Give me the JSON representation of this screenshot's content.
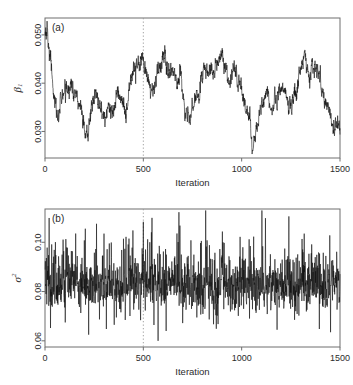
{
  "figure": {
    "background_color": "#ffffff",
    "line_color": "#111111",
    "frame_color": "#6e6e6e",
    "burnin_color": "#9a9a9a"
  },
  "panels": [
    {
      "tag": "(a)",
      "name": "panel-a",
      "ylabel_main": "β",
      "ylabel_sub": "1",
      "ylabel_sup": "",
      "xlabel": "Iteration",
      "xticks": [
        "0",
        "500",
        "1000",
        "1500"
      ],
      "yticks": [
        "0.030",
        "0.040",
        "0.050"
      ]
    },
    {
      "tag": "(b)",
      "name": "panel-b",
      "ylabel_main": "σ",
      "ylabel_sub": "",
      "ylabel_sup": "2",
      "xlabel": "Iteration",
      "xticks": [
        "0",
        "500",
        "1000",
        "1500"
      ],
      "yticks": [
        "0.06",
        "0.08",
        "0.10"
      ]
    }
  ],
  "chart_data": [
    {
      "type": "line",
      "name": "trace-beta1",
      "title": "(a)",
      "xlabel": "Iteration",
      "ylabel": "beta_1",
      "xlim": [
        0,
        1500
      ],
      "ylim": [
        0.0245,
        0.0535
      ],
      "xticks": [
        0,
        500,
        1000,
        1500
      ],
      "yticks": [
        0.03,
        0.04,
        0.05
      ],
      "grid": false,
      "legend": "none",
      "annotations": [
        {
          "kind": "vline",
          "x": 500,
          "style": "dotted",
          "label": "burn-in"
        }
      ],
      "series_description": "Highly autocorrelated MCMC random-walk trace of regression coefficient beta_1; starts near 0.051, descends to ~0.033 by iteration 60, meanders between 0.028 and 0.047, peaks ~0.046 near iteration 490 and 890, and shows a deep excursion to ~0.026 near iteration 1050 before recovering to ~0.044 and declining to ~0.031 at the end.",
      "random_walk_params": {
        "start": 0.0512,
        "mean_level": 0.0392,
        "step_sd": 0.00095,
        "reversion": 0.022,
        "seed": 20147,
        "n": 1500
      },
      "control_points": {
        "x": [
          0,
          10,
          25,
          45,
          62,
          85,
          105,
          130,
          150,
          175,
          200,
          215,
          235,
          255,
          275,
          300,
          320,
          345,
          365,
          390,
          410,
          430,
          450,
          470,
          490,
          505,
          520,
          545,
          565,
          585,
          605,
          625,
          645,
          665,
          690,
          715,
          735,
          750,
          775,
          800,
          825,
          850,
          875,
          895,
          915,
          940,
          960,
          985,
          1010,
          1035,
          1055,
          1075,
          1100,
          1125,
          1150,
          1175,
          1200,
          1225,
          1250,
          1275,
          1300,
          1320,
          1345,
          1365,
          1390,
          1415,
          1440,
          1465,
          1485,
          1500
        ],
        "y": [
          0.0505,
          0.0512,
          0.0455,
          0.0378,
          0.0331,
          0.0372,
          0.0385,
          0.0398,
          0.0381,
          0.0362,
          0.0304,
          0.0288,
          0.0336,
          0.0385,
          0.0352,
          0.0335,
          0.0352,
          0.0336,
          0.0382,
          0.0364,
          0.0332,
          0.0392,
          0.042,
          0.0438,
          0.0455,
          0.0438,
          0.0412,
          0.0378,
          0.0416,
          0.0431,
          0.0462,
          0.042,
          0.0428,
          0.0408,
          0.0415,
          0.0331,
          0.0325,
          0.0356,
          0.0372,
          0.042,
          0.0432,
          0.0418,
          0.0445,
          0.0458,
          0.0432,
          0.0412,
          0.0428,
          0.0402,
          0.0368,
          0.033,
          0.0262,
          0.0298,
          0.0352,
          0.0378,
          0.0348,
          0.0362,
          0.0395,
          0.0372,
          0.0352,
          0.0378,
          0.0425,
          0.0452,
          0.0408,
          0.0444,
          0.0412,
          0.038,
          0.0352,
          0.0312,
          0.0318,
          0.0305
        ]
      }
    },
    {
      "type": "line",
      "name": "trace-sigma2",
      "title": "(b)",
      "xlabel": "Iteration",
      "ylabel": "sigma^2",
      "xlim": [
        0,
        1500
      ],
      "ylim": [
        0.0575,
        0.1135
      ],
      "xticks": [
        0,
        500,
        1000,
        1500
      ],
      "yticks": [
        0.06,
        0.08,
        0.1
      ],
      "grid": false,
      "legend": "none",
      "annotations": [
        {
          "kind": "vline",
          "x": 500,
          "style": "dotted",
          "label": "burn-in"
        }
      ],
      "series_description": "Well-mixed, nearly independent MCMC trace of the error variance sigma^2; dense high-frequency oscillation centred near 0.083 with typical range 0.072-0.095 and occasional spikes reaching 0.112 (near iterations 680 and 1240) and dips to 0.060 (near iteration 575).",
      "noise_params": {
        "mean_level": 0.0832,
        "sd": 0.0062,
        "skew_tail": 0.35,
        "seed": 90553,
        "n": 1500
      },
      "spikes_high": [
        {
          "x": 205,
          "y": 0.1055
        },
        {
          "x": 262,
          "y": 0.1075
        },
        {
          "x": 300,
          "y": 0.1035
        },
        {
          "x": 412,
          "y": 0.1022
        },
        {
          "x": 447,
          "y": 0.1048
        },
        {
          "x": 522,
          "y": 0.1012
        },
        {
          "x": 681,
          "y": 0.1122
        },
        {
          "x": 742,
          "y": 0.1008
        },
        {
          "x": 905,
          "y": 0.1
        },
        {
          "x": 1038,
          "y": 0.1012
        },
        {
          "x": 1240,
          "y": 0.1105
        },
        {
          "x": 1318,
          "y": 0.1035
        },
        {
          "x": 1448,
          "y": 0.1028
        }
      ],
      "spikes_low": [
        {
          "x": 28,
          "y": 0.0652
        },
        {
          "x": 222,
          "y": 0.0625
        },
        {
          "x": 312,
          "y": 0.0648
        },
        {
          "x": 575,
          "y": 0.06
        },
        {
          "x": 616,
          "y": 0.064
        },
        {
          "x": 700,
          "y": 0.0672
        },
        {
          "x": 880,
          "y": 0.0668
        },
        {
          "x": 1180,
          "y": 0.0645
        },
        {
          "x": 1395,
          "y": 0.0648
        },
        {
          "x": 1452,
          "y": 0.0635
        }
      ]
    }
  ]
}
